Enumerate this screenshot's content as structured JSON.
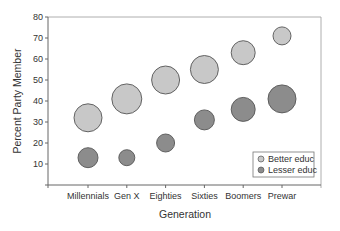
{
  "chart_data": {
    "type": "scatter",
    "subtype": "bubble",
    "title": "",
    "xlabel": "Generation",
    "ylabel": "Percent Party Member",
    "ylim": [
      0,
      80
    ],
    "yticks": [
      10,
      20,
      30,
      40,
      50,
      60,
      70,
      80
    ],
    "categories": [
      "Millennials",
      "Gen X",
      "Eighties",
      "Sixties",
      "Boomers",
      "Prewar"
    ],
    "grid": false,
    "legend_position": "lower right",
    "series": [
      {
        "name": "Better educ",
        "color": "#c8c8c8",
        "values": [
          32,
          41,
          50,
          55,
          63,
          71
        ],
        "bubble_sizes": [
          14,
          15,
          14,
          14,
          12,
          9
        ]
      },
      {
        "name": "Lesser educ",
        "color": "#8c8c8c",
        "values": [
          13,
          13,
          20,
          31,
          36,
          41
        ],
        "bubble_sizes": [
          10,
          8,
          9,
          10,
          12,
          14
        ]
      }
    ]
  },
  "outline_color": "#555555",
  "axis_color": "#666666"
}
